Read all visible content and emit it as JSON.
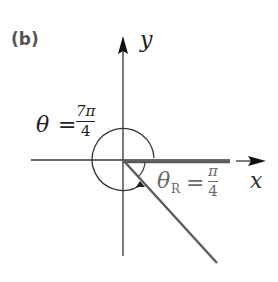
{
  "figure": {
    "part_label": "(b)",
    "x_axis_label": "x",
    "y_axis_label": "y",
    "theta": {
      "symbol": "θ",
      "equals": "=",
      "numerator": "7π",
      "denominator": "4"
    },
    "theta_ref": {
      "symbol": "θ",
      "subscript": "R",
      "equals": "=",
      "numerator": "π",
      "denominator": "4"
    },
    "colors": {
      "axis": "#333333",
      "ray": "#5a5a5a",
      "label_ref": "#6a6a6a"
    }
  }
}
